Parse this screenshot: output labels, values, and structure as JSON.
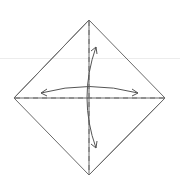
{
  "diagram": {
    "type": "origami-step",
    "shape": "square-as-diamond",
    "colors": {
      "background": "#ffffff",
      "edge": "#6a6a6a",
      "arrow": "#555555",
      "guide": "#ececec"
    },
    "vertices": {
      "top": [
        89,
        20
      ],
      "left": [
        14,
        98
      ],
      "right": [
        165,
        98
      ],
      "bottom": [
        89,
        175
      ]
    },
    "fold_lines": [
      {
        "name": "vertical-valley-fold",
        "style": "dashed",
        "from": [
          89,
          20
        ],
        "to": [
          89,
          175
        ]
      },
      {
        "name": "horizontal-valley-fold",
        "style": "dashed",
        "from": [
          14,
          98
        ],
        "to": [
          165,
          98
        ]
      }
    ],
    "arrows": [
      {
        "name": "horizontal-fold-unfold-arrow",
        "direction": "left-right",
        "bidirectional": true
      },
      {
        "name": "vertical-fold-unfold-arrow",
        "direction": "up-down",
        "bidirectional": true
      }
    ]
  }
}
